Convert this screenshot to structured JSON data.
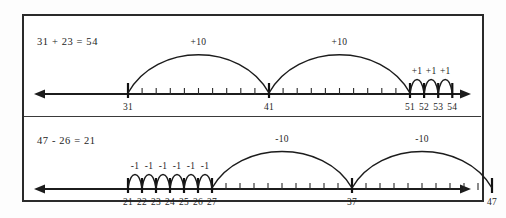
{
  "worksheet": {
    "title": "Number line addition and subtraction jumps",
    "background": "#ffffff",
    "ink_color": "#1c1c1c",
    "border_color": "#2a2a2a"
  },
  "panels": [
    {
      "id": "addition",
      "equation": "31 + 23 = 54",
      "operation": "addition",
      "axis": {
        "start_value": 31,
        "end_value": 54,
        "left_arrow": true,
        "right_arrow": true,
        "tick_step": 1,
        "pixels_per_unit": 14.1,
        "origin_x": 104,
        "line_y": 78,
        "minor_tick_range": [
          31,
          54
        ]
      },
      "labeled_ticks": [
        {
          "value": 31,
          "label": "31"
        },
        {
          "value": 41,
          "label": "41"
        },
        {
          "value": 51,
          "label": "51"
        },
        {
          "value": 52,
          "label": "52"
        },
        {
          "value": 53,
          "label": "53"
        },
        {
          "value": 54,
          "label": "54"
        }
      ],
      "jumps": [
        {
          "from": 31,
          "to": 41,
          "label": "+10",
          "height": 44
        },
        {
          "from": 41,
          "to": 51,
          "label": "+10",
          "height": 44
        },
        {
          "from": 51,
          "to": 52,
          "label": "+1",
          "height": 16
        },
        {
          "from": 52,
          "to": 53,
          "label": "+1",
          "height": 16
        },
        {
          "from": 53,
          "to": 54,
          "label": "+1",
          "height": 16
        }
      ]
    },
    {
      "id": "subtraction",
      "equation": "47 - 26 = 21",
      "operation": "subtraction",
      "axis": {
        "start_value": 21,
        "end_value": 47,
        "left_arrow": true,
        "right_arrow": true,
        "tick_step": 1,
        "pixels_per_unit": 14.0,
        "origin_x": 104,
        "line_y": 72,
        "minor_tick_range": [
          21,
          47
        ]
      },
      "labeled_ticks": [
        {
          "value": 21,
          "label": "21"
        },
        {
          "value": 22,
          "label": "22"
        },
        {
          "value": 23,
          "label": "23"
        },
        {
          "value": 24,
          "label": "24"
        },
        {
          "value": 25,
          "label": "25"
        },
        {
          "value": 26,
          "label": "26"
        },
        {
          "value": 27,
          "label": "27"
        },
        {
          "value": 37,
          "label": "37"
        },
        {
          "value": 47,
          "label": "47"
        }
      ],
      "jumps": [
        {
          "from": 21,
          "to": 22,
          "label": "-1",
          "height": 16
        },
        {
          "from": 22,
          "to": 23,
          "label": "-1",
          "height": 16
        },
        {
          "from": 23,
          "to": 24,
          "label": "-1",
          "height": 16
        },
        {
          "from": 24,
          "to": 25,
          "label": "-1",
          "height": 16
        },
        {
          "from": 25,
          "to": 26,
          "label": "-1",
          "height": 16
        },
        {
          "from": 26,
          "to": 27,
          "label": "-1",
          "height": 16
        },
        {
          "from": 27,
          "to": 37,
          "label": "-10",
          "height": 42
        },
        {
          "from": 37,
          "to": 47,
          "label": "-10",
          "height": 42
        }
      ]
    }
  ]
}
